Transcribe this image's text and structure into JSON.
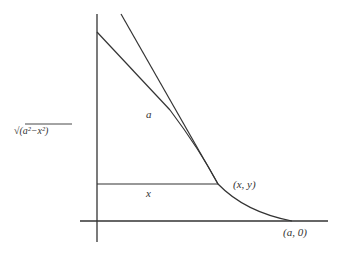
{
  "diagram": {
    "labels": {
      "hypotenuse": "a",
      "horizontal": "x",
      "point": "(x, y)",
      "intercept": "(a, 0)",
      "vertical_length": "√(a²−x²)"
    },
    "stroke_color": "#333333"
  }
}
